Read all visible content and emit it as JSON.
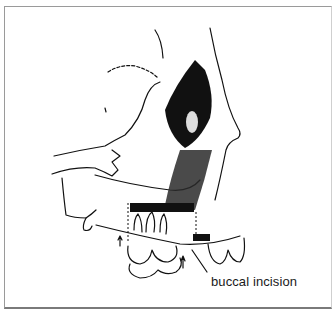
{
  "figure": {
    "annotations": [
      {
        "label": "buccal incision"
      }
    ],
    "colors": {
      "ink": "#111111",
      "frame": "#9a9a9a",
      "background": "#ffffff"
    }
  }
}
